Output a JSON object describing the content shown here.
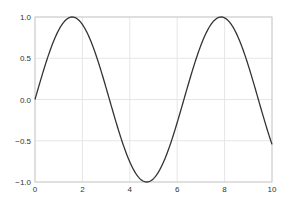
{
  "chart_data": {
    "type": "line",
    "title": "",
    "xlabel": "",
    "ylabel": "",
    "xlim": [
      0,
      10
    ],
    "ylim": [
      -1.0,
      1.0
    ],
    "grid": true,
    "legend": null,
    "x_ticks": [
      "0",
      "2",
      "4",
      "6",
      "8",
      "10"
    ],
    "y_ticks": [
      "-1.0",
      "-0.5",
      "0.0",
      "0.5",
      "1.0"
    ],
    "series": [
      {
        "name": "sin(x)",
        "function": "sin(x)",
        "color": "#333333",
        "x": [
          0,
          0.5,
          1,
          1.5,
          2,
          2.5,
          3,
          3.5,
          4,
          4.5,
          5,
          5.5,
          6,
          6.5,
          7,
          7.5,
          8,
          8.5,
          9,
          9.5,
          10
        ],
        "y": [
          0.0,
          0.479,
          0.841,
          0.997,
          0.909,
          0.598,
          0.141,
          -0.351,
          -0.757,
          -0.978,
          -0.959,
          -0.706,
          -0.279,
          0.215,
          0.657,
          0.938,
          0.989,
          0.798,
          0.412,
          -0.075,
          -0.544
        ]
      }
    ]
  },
  "colors": {
    "background": "#ffffff",
    "grid": "#e6e6e6",
    "axes_edge": "#cccccc",
    "line": "#333333",
    "tick_label": "#333333"
  }
}
